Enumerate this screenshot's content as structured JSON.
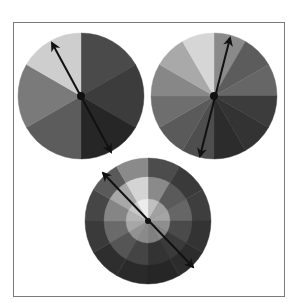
{
  "frame": {
    "x": 13,
    "y": 22,
    "width": 270,
    "height": 273,
    "border": "#7a7a7a"
  },
  "wheels": [
    {
      "name": "six-segment-wheel",
      "cx": 81,
      "cy": 96,
      "r": 63,
      "segments": 6,
      "rings": [
        {
          "r": 63,
          "colors": [
            "#4a4a4a",
            "#3c3c3c",
            "#262626",
            "#5c5c5c",
            "#7a7a7a",
            "#cecece"
          ]
        }
      ],
      "arrow": {
        "from": [
          111,
          152
        ],
        "to": [
          52,
          43
        ]
      },
      "hub_radius": 4
    },
    {
      "name": "twelve-segment-wheel",
      "cx": 214,
      "cy": 96,
      "r": 63,
      "segments": 12,
      "rings": [
        {
          "r": 63,
          "colors": [
            "#8a8a8a",
            "#5c5c5c",
            "#666666",
            "#3c3c3c",
            "#333333",
            "#2c2c2c",
            "#4e4e4e",
            "#5a5a5a",
            "#6e6e6e",
            "#878787",
            "#a9a9a9",
            "#d6d6d6"
          ]
        }
      ],
      "arrow": {
        "from": [
          200,
          156
        ],
        "to": [
          230,
          38
        ]
      },
      "hub_radius": 4
    },
    {
      "name": "ringed-twelve-segment-wheel",
      "cx": 148,
      "cy": 221,
      "r": 63,
      "segments": 12,
      "rings": [
        {
          "r": 63,
          "colors": [
            "#4c4c4c",
            "#3a3a3a",
            "#3e3e3e",
            "#333333",
            "#2c2c2c",
            "#262626",
            "#2a2a2a",
            "#2e2e2e",
            "#3a3a3a",
            "#464646",
            "#5a5a5a",
            "#8a8a8a"
          ]
        },
        {
          "r": 44,
          "colors": [
            "#8a8a8a",
            "#5a5a5a",
            "#666666",
            "#4a4a4a",
            "#3a3a3a",
            "#333333",
            "#444444",
            "#555555",
            "#6a6a6a",
            "#858585",
            "#a8a8a8",
            "#d4d4d4"
          ]
        },
        {
          "r": 22,
          "colors": [
            "#c0c0c0",
            "#a0a0a0",
            "#a4a4a4",
            "#8e8e8e",
            "#868686",
            "#808080",
            "#8a8a8a",
            "#929292",
            "#a6a6a6",
            "#b4b4b4",
            "#c8c8c8",
            "#ececec"
          ]
        }
      ],
      "arrow": {
        "from": [
          193,
          267
        ],
        "to": [
          103,
          173
        ]
      },
      "hub_radius": 3
    }
  ],
  "arrow_color": "#111111"
}
